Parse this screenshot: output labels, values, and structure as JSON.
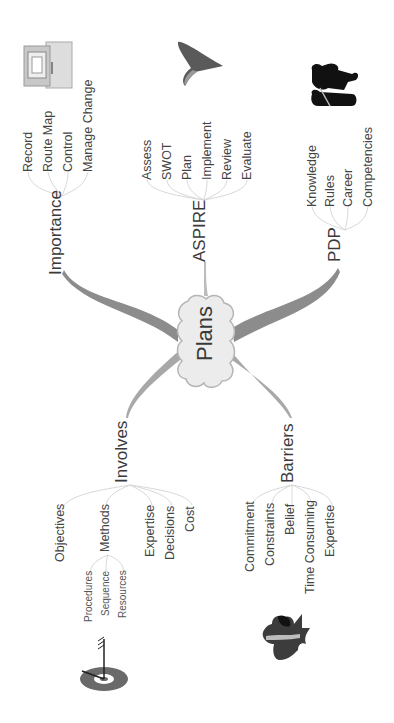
{
  "center": {
    "label": "Plans"
  },
  "branches": {
    "importance": {
      "label": "Importance",
      "children": [
        "Record",
        "Route Map",
        "Control",
        "Manage Change"
      ],
      "icon": "computer-icon"
    },
    "aspire": {
      "label": "ASPIRE",
      "children": [
        "Assess",
        "SWOT",
        "Plan",
        "Implement",
        "Review",
        "Evaluate"
      ],
      "icon": "arrow-icon"
    },
    "pdp": {
      "label": "PDP",
      "children": [
        "Knowledge",
        "Rules",
        "Career",
        "Competencies"
      ],
      "icon": "people-icon"
    },
    "involves": {
      "label": "Involves",
      "children": [
        "Objectives",
        "Methods",
        "Expertise",
        "Decisions",
        "Cost"
      ],
      "methods_children": [
        "Procedures",
        "Sequence",
        "Resources"
      ],
      "icon": "target-icon"
    },
    "barriers": {
      "label": "Barriers",
      "children": [
        "Commitment",
        "Constraints",
        "Belief",
        "Time Consuming",
        "Expertise"
      ],
      "icon": "hurdle-icon"
    }
  },
  "colors": {
    "branch": "#8c8c8c",
    "cloud_fill": "#ececec",
    "cloud_stroke": "#b5b5b5",
    "thin_link": "#d8d8d8"
  }
}
